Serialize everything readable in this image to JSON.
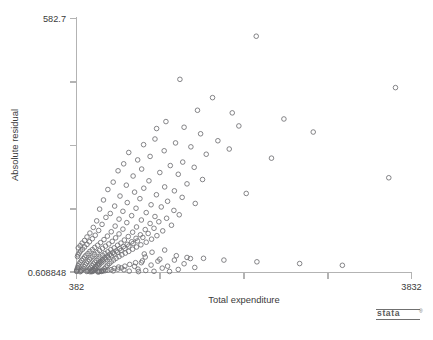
{
  "chart_data": {
    "type": "scatter",
    "title": "",
    "xlabel": "Total expenditure",
    "ylabel": "Absolute residual",
    "xlim": [
      382,
      3832
    ],
    "ylim": [
      0.608848,
      582.7
    ],
    "xticklabels": [
      "382",
      "3832"
    ],
    "yticklabels": [
      "582.7",
      "0.608848"
    ],
    "x_tick_count": 5,
    "y_tick_count": 5,
    "grid": false,
    "legend": null,
    "marker": "open-circle",
    "marker_color": "#6f6f73",
    "background_color": "#ffffff",
    "axis_color": "#b3b3b3",
    "points": [
      [
        2233,
        542
      ],
      [
        1447,
        443
      ],
      [
        3667,
        424
      ],
      [
        1783,
        401
      ],
      [
        1628,
        372
      ],
      [
        1986,
        366
      ],
      [
        2518,
        352
      ],
      [
        1303,
        346
      ],
      [
        2054,
        336
      ],
      [
        1490,
        333
      ],
      [
        1207,
        330
      ],
      [
        2820,
        322
      ],
      [
        1660,
        318
      ],
      [
        1190,
        306
      ],
      [
        1838,
        302
      ],
      [
        1402,
        297
      ],
      [
        1073,
        293
      ],
      [
        1560,
        288
      ],
      [
        1955,
        283
      ],
      [
        1285,
        279
      ],
      [
        920,
        275
      ],
      [
        1718,
        271
      ],
      [
        1140,
        266
      ],
      [
        2390,
        262
      ],
      [
        1012,
        258
      ],
      [
        1476,
        253
      ],
      [
        868,
        249
      ],
      [
        1348,
        245
      ],
      [
        1594,
        241
      ],
      [
        1053,
        237
      ],
      [
        810,
        233
      ],
      [
        1240,
        229
      ],
      [
        1430,
        225
      ],
      [
        965,
        221
      ],
      [
        3598,
        217
      ],
      [
        1680,
        213
      ],
      [
        1128,
        210
      ],
      [
        760,
        207
      ],
      [
        1520,
        203
      ],
      [
        895,
        200
      ],
      [
        1290,
        196
      ],
      [
        1075,
        193
      ],
      [
        705,
        190
      ],
      [
        1390,
        187
      ],
      [
        980,
        184
      ],
      [
        2130,
        181
      ],
      [
        1205,
        178
      ],
      [
        830,
        175
      ],
      [
        1470,
        172
      ],
      [
        1035,
        169
      ],
      [
        660,
        166
      ],
      [
        1320,
        163
      ],
      [
        905,
        160
      ],
      [
        1605,
        158
      ],
      [
        1150,
        155
      ],
      [
        775,
        152
      ],
      [
        1255,
        150
      ],
      [
        995,
        147
      ],
      [
        620,
        145
      ],
      [
        1385,
        142
      ],
      [
        860,
        140
      ],
      [
        1100,
        137
      ],
      [
        730,
        135
      ],
      [
        1440,
        132
      ],
      [
        950,
        130
      ],
      [
        1190,
        128
      ],
      [
        685,
        126
      ],
      [
        1310,
        124
      ],
      [
        820,
        122
      ],
      [
        1050,
        120
      ],
      [
        590,
        118
      ],
      [
        1230,
        116
      ],
      [
        900,
        114
      ],
      [
        1140,
        112
      ],
      [
        645,
        110
      ],
      [
        1360,
        108
      ],
      [
        780,
        106
      ],
      [
        1000,
        104
      ],
      [
        555,
        103
      ],
      [
        1180,
        101
      ],
      [
        860,
        99
      ],
      [
        1090,
        98
      ],
      [
        610,
        96
      ],
      [
        1270,
        95
      ],
      [
        740,
        93
      ],
      [
        960,
        92
      ],
      [
        520,
        90
      ],
      [
        1120,
        89
      ],
      [
        820,
        88
      ],
      [
        1040,
        86
      ],
      [
        575,
        85
      ],
      [
        1210,
        84
      ],
      [
        700,
        83
      ],
      [
        915,
        82
      ],
      [
        490,
        81
      ],
      [
        1065,
        80
      ],
      [
        785,
        79
      ],
      [
        995,
        78
      ],
      [
        545,
        77
      ],
      [
        1155,
        76
      ],
      [
        665,
        75
      ],
      [
        875,
        74
      ],
      [
        465,
        73
      ],
      [
        1010,
        72
      ],
      [
        750,
        71
      ],
      [
        950,
        70
      ],
      [
        515,
        70
      ],
      [
        1100,
        69
      ],
      [
        630,
        68
      ],
      [
        840,
        67
      ],
      [
        440,
        67
      ],
      [
        965,
        66
      ],
      [
        715,
        65
      ],
      [
        905,
        64
      ],
      [
        490,
        64
      ],
      [
        1045,
        63
      ],
      [
        600,
        62
      ],
      [
        805,
        62
      ],
      [
        420,
        61
      ],
      [
        920,
        60
      ],
      [
        680,
        60
      ],
      [
        865,
        59
      ],
      [
        465,
        58
      ],
      [
        1000,
        58
      ],
      [
        570,
        57
      ],
      [
        770,
        56
      ],
      [
        400,
        56
      ],
      [
        880,
        55
      ],
      [
        650,
        55
      ],
      [
        825,
        54
      ],
      [
        445,
        53
      ],
      [
        960,
        53
      ],
      [
        545,
        52
      ],
      [
        735,
        52
      ],
      [
        1290,
        51
      ],
      [
        840,
        50
      ],
      [
        620,
        50
      ],
      [
        790,
        49
      ],
      [
        425,
        49
      ],
      [
        920,
        48
      ],
      [
        520,
        48
      ],
      [
        705,
        47
      ],
      [
        1160,
        46
      ],
      [
        805,
        46
      ],
      [
        595,
        45
      ],
      [
        755,
        45
      ],
      [
        410,
        44
      ],
      [
        885,
        44
      ],
      [
        500,
        43
      ],
      [
        675,
        43
      ],
      [
        1080,
        42
      ],
      [
        770,
        42
      ],
      [
        570,
        41
      ],
      [
        725,
        41
      ],
      [
        398,
        40
      ],
      [
        850,
        40
      ],
      [
        480,
        39
      ],
      [
        650,
        39
      ],
      [
        1410,
        38
      ],
      [
        740,
        38
      ],
      [
        550,
        37
      ],
      [
        700,
        37
      ],
      [
        392,
        36
      ],
      [
        820,
        36
      ],
      [
        465,
        35
      ],
      [
        625,
        35
      ],
      [
        1520,
        34
      ],
      [
        710,
        34
      ],
      [
        530,
        33
      ],
      [
        675,
        33
      ],
      [
        1690,
        32
      ],
      [
        790,
        32
      ],
      [
        450,
        31
      ],
      [
        605,
        31
      ],
      [
        1240,
        30
      ],
      [
        685,
        30
      ],
      [
        515,
        29
      ],
      [
        650,
        29
      ],
      [
        1900,
        28
      ],
      [
        765,
        28
      ],
      [
        435,
        27
      ],
      [
        585,
        27
      ],
      [
        1060,
        26
      ],
      [
        660,
        26
      ],
      [
        500,
        25
      ],
      [
        630,
        25
      ],
      [
        2240,
        24
      ],
      [
        740,
        24
      ],
      [
        420,
        23
      ],
      [
        570,
        23
      ],
      [
        990,
        22
      ],
      [
        640,
        22
      ],
      [
        485,
        21
      ],
      [
        610,
        21
      ],
      [
        2680,
        20
      ],
      [
        720,
        20
      ],
      [
        408,
        19
      ],
      [
        555,
        19
      ],
      [
        930,
        18
      ],
      [
        620,
        18
      ],
      [
        472,
        17
      ],
      [
        595,
        17
      ],
      [
        3120,
        16
      ],
      [
        700,
        16
      ],
      [
        400,
        15
      ],
      [
        540,
        15
      ],
      [
        880,
        14
      ],
      [
        605,
        14
      ],
      [
        460,
        13
      ],
      [
        580,
        13
      ],
      [
        815,
        12
      ],
      [
        685,
        12
      ],
      [
        395,
        11
      ],
      [
        528,
        11
      ],
      [
        845,
        10
      ],
      [
        590,
        10
      ],
      [
        450,
        9
      ],
      [
        566,
        9
      ],
      [
        770,
        9
      ],
      [
        668,
        8
      ],
      [
        390,
        8
      ],
      [
        516,
        8
      ],
      [
        808,
        7
      ],
      [
        576,
        7
      ],
      [
        441,
        6
      ],
      [
        553,
        6
      ],
      [
        738,
        6
      ],
      [
        652,
        5
      ],
      [
        386,
        5
      ],
      [
        505,
        5
      ],
      [
        705,
        5
      ],
      [
        563,
        4
      ],
      [
        433,
        4
      ],
      [
        541,
        4
      ],
      [
        680,
        4
      ],
      [
        637,
        3
      ],
      [
        384,
        3
      ],
      [
        496,
        3
      ],
      [
        660,
        3
      ],
      [
        551,
        2.5
      ],
      [
        426,
        2.5
      ],
      [
        530,
        2.5
      ],
      [
        640,
        2
      ],
      [
        622,
        2
      ],
      [
        383,
        2
      ],
      [
        488,
        1.8
      ],
      [
        615,
        1.6
      ],
      [
        540,
        1.4
      ],
      [
        420,
        1.3
      ],
      [
        522,
        1.2
      ],
      [
        600,
        1.1
      ],
      [
        608,
        1.0
      ],
      [
        1020,
        1.5
      ],
      [
        1180,
        2.2
      ],
      [
        1340,
        1.8
      ],
      [
        760,
        3.2
      ],
      [
        925,
        2.6
      ],
      [
        1095,
        4.1
      ],
      [
        870,
        5.8
      ],
      [
        1015,
        7.2
      ],
      [
        1265,
        9.5
      ],
      [
        1430,
        6.4
      ],
      [
        1600,
        11.0
      ],
      [
        980,
        13.5
      ],
      [
        1150,
        16.5
      ],
      [
        1320,
        14.0
      ],
      [
        1490,
        19.5
      ],
      [
        1050,
        22.0
      ],
      [
        1220,
        25.5
      ],
      [
        1390,
        28.0
      ],
      [
        1555,
        31.5
      ],
      [
        1090,
        35.0
      ]
    ]
  },
  "footer": {
    "stata_logo_text": "stata",
    "stata_logo_tm": "®",
    "caption": ""
  }
}
